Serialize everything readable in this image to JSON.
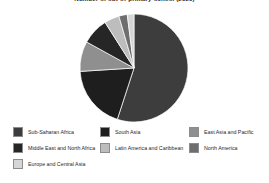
{
  "chart_data": {
    "type": "pie",
    "title": "Number of out-of-primary-school (2020)",
    "legend_position": "bottom",
    "grid": false,
    "xlabel": "",
    "ylabel": "",
    "categories": [
      "Sub-Saharan Africa",
      "South Asia",
      "East Asia and Pacific",
      "Middle East and North Africa",
      "Latin America and Caribbean",
      "North America",
      "Europe and Central Asia"
    ],
    "values": [
      55,
      19,
      9,
      8,
      4.5,
      2.5,
      2
    ],
    "colors": [
      "#3d3d3d",
      "#1e1e1e",
      "#8f8f8f",
      "#262626",
      "#bdbdbd",
      "#6e6e6e",
      "#d6d6d6"
    ]
  },
  "legend": {
    "items": [
      {
        "label": "Sub-Saharan Africa",
        "color": "#3d3d3d",
        "row": 0,
        "col": 0
      },
      {
        "label": "South Asia",
        "color": "#1e1e1e",
        "row": 0,
        "col": 1
      },
      {
        "label": "East Asia and Pacific",
        "color": "#8f8f8f",
        "row": 0,
        "col": 2
      },
      {
        "label": "Middle East and North Africa",
        "color": "#262626",
        "row": 1,
        "col": 0
      },
      {
        "label": "Latin America and Caribbean",
        "color": "#bdbdbd",
        "row": 1,
        "col": 1
      },
      {
        "label": "North America",
        "color": "#6e6e6e",
        "row": 1,
        "col": 2
      },
      {
        "label": "Europe and Central Asia",
        "color": "#d6d6d6",
        "row": 2,
        "col": 0
      }
    ]
  }
}
